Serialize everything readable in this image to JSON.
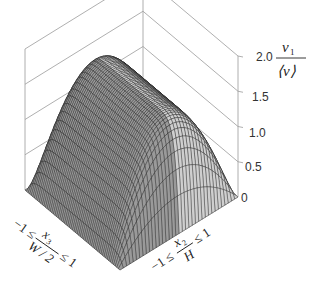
{
  "chart_data": {
    "type": "surface3d",
    "title": "",
    "zlabel": {
      "numerator": "v",
      "numerator_sub": "1",
      "denominator": "⟨v⟩"
    },
    "xlabel": {
      "prefix": "−1 ≤",
      "numerator": "x",
      "numerator_sub": "3",
      "denominator": "W / 2",
      "suffix": "≤ 1"
    },
    "ylabel": {
      "prefix": "−1 ≤",
      "numerator": "x",
      "numerator_sub": "2",
      "denominator": "H",
      "suffix": "≤ 1"
    },
    "z_ticks": [
      "0",
      "0.5",
      "1.0",
      "1.5",
      "2.0"
    ],
    "zlim": [
      0,
      2.0
    ],
    "x_range": [
      -1,
      1
    ],
    "y_range": [
      -1,
      1
    ],
    "peak_value": 1.5,
    "grid": true,
    "colors": {
      "mesh": "#111111",
      "base": "#c8c8c8",
      "box": "#9a9a9a"
    }
  }
}
